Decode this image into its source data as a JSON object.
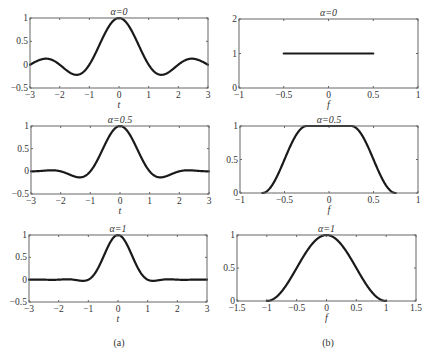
{
  "figure": {
    "caption_a": "(a)",
    "caption_b": "(b)"
  },
  "chart_data": [
    {
      "id": "a1",
      "type": "line",
      "title": "α=0",
      "xlabel": "t",
      "ylabel": "",
      "xlim": [
        -3,
        3
      ],
      "ylim": [
        -0.5,
        1
      ],
      "xticks": [
        -3,
        -2,
        -1,
        0,
        1,
        2,
        3
      ],
      "yticks": [
        -0.5,
        0,
        0.5,
        1
      ],
      "xtick_labels": [
        "−3",
        "−2",
        "−1",
        "0",
        "1",
        "2",
        "3"
      ],
      "ytick_labels": [
        "−0.5",
        "0",
        "0.5",
        "1"
      ],
      "function": "raised_cosine_time",
      "alpha": 0,
      "x": [
        -3,
        -2.5,
        -2,
        -1.5,
        -1.43,
        -1,
        -0.5,
        0,
        0.5,
        1,
        1.43,
        1.5,
        2,
        2.5,
        3
      ],
      "y": [
        0,
        0.13,
        0,
        -0.21,
        -0.22,
        0,
        0.64,
        1,
        0.64,
        0,
        -0.22,
        -0.21,
        0,
        0.13,
        0
      ],
      "box": [
        30,
        18,
        208,
        88
      ]
    },
    {
      "id": "b1",
      "type": "line",
      "title": "α=0",
      "xlabel": "f",
      "ylabel": "",
      "xlim": [
        -1,
        1
      ],
      "ylim": [
        0,
        2
      ],
      "xticks": [
        -1,
        -0.5,
        0,
        0.5,
        1
      ],
      "yticks": [
        0,
        1,
        2
      ],
      "xtick_labels": [
        "−1",
        "−0.5",
        "0",
        "0.5",
        "1"
      ],
      "ytick_labels": [
        "0",
        "1",
        "2"
      ],
      "function": "raised_cosine_freq",
      "alpha": 0,
      "x": [
        -0.5,
        0.5
      ],
      "y": [
        1,
        1
      ],
      "box": [
        239,
        19,
        418,
        88
      ]
    },
    {
      "id": "a2",
      "type": "line",
      "title": "α=0.5",
      "xlabel": "t",
      "ylabel": "",
      "xlim": [
        -3,
        3
      ],
      "ylim": [
        -0.5,
        1
      ],
      "xticks": [
        -3,
        -2,
        -1,
        0,
        1,
        2,
        3
      ],
      "yticks": [
        -0.5,
        0,
        0.5,
        1
      ],
      "xtick_labels": [
        "−3",
        "−2",
        "−1",
        "0",
        "1",
        "2",
        "3"
      ],
      "ytick_labels": [
        "−0.5",
        "0",
        "0.5",
        "1"
      ],
      "function": "raised_cosine_time",
      "alpha": 0.5,
      "x": [
        -3,
        -2.5,
        -2,
        -1.5,
        -1.3,
        -1,
        -0.5,
        0,
        0.5,
        1,
        1.3,
        1.5,
        2,
        2.5,
        3
      ],
      "y": [
        0,
        0.01,
        0,
        -0.1,
        -0.12,
        0,
        0.57,
        1,
        0.57,
        0,
        -0.12,
        -0.1,
        0,
        0.01,
        0
      ],
      "box": [
        31,
        126,
        209,
        194
      ]
    },
    {
      "id": "b2",
      "type": "line",
      "title": "α=0.5",
      "xlabel": "f",
      "ylabel": "",
      "xlim": [
        -1,
        1
      ],
      "ylim": [
        0,
        1
      ],
      "xticks": [
        -1,
        -0.5,
        0,
        0.5,
        1
      ],
      "yticks": [
        0,
        0.5,
        1
      ],
      "xtick_labels": [
        "−1",
        "−0.5",
        "0",
        "0.5",
        "1"
      ],
      "ytick_labels": [
        "0",
        "0.5",
        "1"
      ],
      "function": "raised_cosine_freq",
      "alpha": 0.5,
      "x": [
        -0.75,
        -0.5,
        -0.25,
        0,
        0.25,
        0.5,
        0.75
      ],
      "y": [
        0,
        0.5,
        1,
        1,
        1,
        0.5,
        0
      ],
      "box": [
        240,
        126,
        418,
        193
      ]
    },
    {
      "id": "a3",
      "type": "line",
      "title": "α=1",
      "xlabel": "t",
      "ylabel": "",
      "xlim": [
        -3,
        3
      ],
      "ylim": [
        -0.5,
        1
      ],
      "xticks": [
        -3,
        -2,
        -1,
        0,
        1,
        2,
        3
      ],
      "yticks": [
        -0.5,
        0,
        0.5,
        1
      ],
      "xtick_labels": [
        "−3",
        "−2",
        "−1",
        "0",
        "1",
        "2",
        "3"
      ],
      "ytick_labels": [
        "−0.5",
        "0",
        "0.5",
        "1"
      ],
      "function": "raised_cosine_time",
      "alpha": 1,
      "x": [
        -3,
        -2,
        -1.5,
        -1,
        -0.5,
        0,
        0.5,
        1,
        1.5,
        2,
        3
      ],
      "y": [
        0,
        0,
        0.01,
        0,
        0.5,
        1,
        0.5,
        0,
        0.01,
        0,
        0
      ],
      "box": [
        29,
        235,
        207,
        302
      ]
    },
    {
      "id": "b3",
      "type": "line",
      "title": "α=1",
      "xlabel": "f",
      "ylabel": "",
      "xlim": [
        -1.5,
        1.5
      ],
      "ylim": [
        0,
        1
      ],
      "xticks": [
        -1.5,
        -1,
        -0.5,
        0,
        0.5,
        1,
        1.5
      ],
      "yticks": [
        0,
        0.5,
        1
      ],
      "xtick_labels": [
        "−1.5",
        "−1",
        "−0.5",
        "0",
        "0.5",
        "1",
        "1.5"
      ],
      "ytick_labels": [
        "0",
        "0.5",
        "1"
      ],
      "function": "raised_cosine_freq",
      "alpha": 1,
      "x": [
        -1,
        -0.5,
        0,
        0.5,
        1
      ],
      "y": [
        0,
        0.5,
        1,
        0.5,
        0
      ],
      "box": [
        237,
        235,
        416,
        301
      ]
    }
  ]
}
